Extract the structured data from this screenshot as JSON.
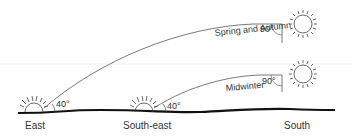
{
  "diagram": {
    "paths": [
      {
        "name": "Spring and Autumn",
        "label": "Spring and Autumn",
        "max_angle": "90°"
      },
      {
        "name": "Midwinter",
        "label": "Midwinter",
        "max_angle": "90°"
      }
    ],
    "directions": [
      "East",
      "South-east",
      "South"
    ],
    "rise_angle_east": "40°",
    "rise_angle_southeast": "40°",
    "colors": {
      "line": "#444444",
      "ground": "#111111",
      "text": "#333333"
    }
  }
}
